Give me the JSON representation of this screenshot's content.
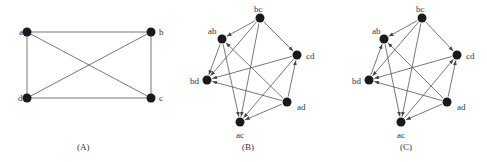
{
  "figure": {
    "panels": [
      {
        "id": "A",
        "caption": "(A)",
        "caption_pos": [
          77,
          150
        ],
        "directed": false,
        "nodes": [
          {
            "id": "a",
            "label": "a",
            "x": 27,
            "y": 32,
            "lx": 19,
            "ly": 35
          },
          {
            "id": "b",
            "label": "b",
            "x": 151,
            "y": 32,
            "lx": 159,
            "ly": 35
          },
          {
            "id": "c",
            "label": "c",
            "x": 151,
            "y": 98,
            "lx": 159,
            "ly": 101
          },
          {
            "id": "d",
            "label": "d",
            "x": 27,
            "y": 98,
            "lx": 18,
            "ly": 101
          }
        ],
        "edges": [
          [
            "a",
            "b"
          ],
          [
            "b",
            "c"
          ],
          [
            "c",
            "d"
          ],
          [
            "d",
            "a"
          ],
          [
            "a",
            "c"
          ],
          [
            "b",
            "d"
          ]
        ]
      },
      {
        "id": "B",
        "caption": "(B)",
        "caption_pos": [
          242,
          150
        ],
        "directed": true,
        "nodes": [
          {
            "id": "bc",
            "label": "bc",
            "x": 260,
            "y": 18,
            "lx": 254,
            "ly": 12
          },
          {
            "id": "ab",
            "label": "ab",
            "x": 222,
            "y": 39,
            "lx": 208,
            "ly": 34
          },
          {
            "id": "cd",
            "label": "cd",
            "x": 297,
            "y": 55,
            "lx": 306,
            "ly": 59
          },
          {
            "id": "bd",
            "label": "bd",
            "x": 207,
            "y": 80,
            "lx": 190,
            "ly": 84
          },
          {
            "id": "ad",
            "label": "ad",
            "x": 287,
            "y": 102,
            "lx": 297,
            "ly": 110
          },
          {
            "id": "ac",
            "label": "ac",
            "x": 240,
            "y": 122,
            "lx": 236,
            "ly": 138
          }
        ],
        "edges": [
          [
            "bc",
            "ab"
          ],
          [
            "bc",
            "cd"
          ],
          [
            "bc",
            "bd"
          ],
          [
            "bc",
            "ac"
          ],
          [
            "ab",
            "bd"
          ],
          [
            "ab",
            "ac"
          ],
          [
            "cd",
            "bd"
          ],
          [
            "cd",
            "ac"
          ],
          [
            "ad",
            "ab"
          ],
          [
            "ad",
            "bd"
          ],
          [
            "ad",
            "cd"
          ],
          [
            "ad",
            "ac"
          ]
        ]
      },
      {
        "id": "C",
        "caption": "(C)",
        "caption_pos": [
          400,
          150
        ],
        "directed": true,
        "nodes": [
          {
            "id": "bc",
            "label": "bc",
            "x": 422,
            "y": 18,
            "lx": 416,
            "ly": 12
          },
          {
            "id": "ab",
            "label": "ab",
            "x": 384,
            "y": 39,
            "lx": 372,
            "ly": 34
          },
          {
            "id": "cd",
            "label": "cd",
            "x": 457,
            "y": 55,
            "lx": 466,
            "ly": 59
          },
          {
            "id": "bd",
            "label": "bd",
            "x": 369,
            "y": 80,
            "lx": 352,
            "ly": 84
          },
          {
            "id": "ad",
            "label": "ad",
            "x": 447,
            "y": 102,
            "lx": 457,
            "ly": 110
          },
          {
            "id": "ac",
            "label": "ac",
            "x": 401,
            "y": 122,
            "lx": 397,
            "ly": 138
          }
        ],
        "edges": [
          [
            "bc",
            "ab"
          ],
          [
            "bc",
            "cd"
          ],
          [
            "bc",
            "bd"
          ],
          [
            "bc",
            "ac"
          ],
          [
            "bd",
            "ab"
          ],
          [
            "ab",
            "ac"
          ],
          [
            "cd",
            "bd"
          ],
          [
            "ac",
            "cd"
          ],
          [
            "ad",
            "ab"
          ],
          [
            "ad",
            "bd"
          ],
          [
            "ad",
            "cd"
          ],
          [
            "ad",
            "ac"
          ]
        ]
      }
    ],
    "style": {
      "node_color": "#1a1a1a",
      "edge_color": "#555555",
      "node_radius": 4.5
    }
  }
}
